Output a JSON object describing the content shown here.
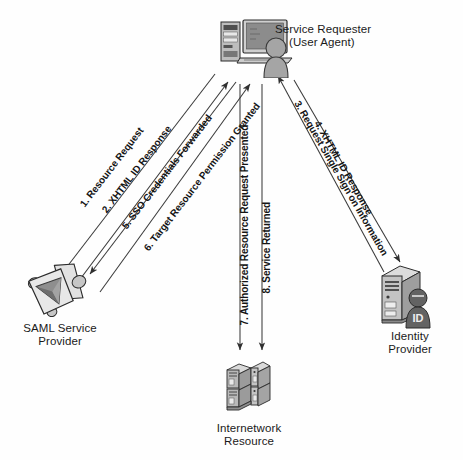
{
  "diagram": {
    "background_color": "#fefefe",
    "line_color": "#3a3a3a",
    "icon_fill_light": "#d4d4d4",
    "icon_fill_mid": "#a8a8a8",
    "icon_fill_dark": "#6f6f6f",
    "icon_outline": "#2b2b2b"
  },
  "nodes": [
    {
      "id": "service-requester",
      "label_line1": "Service Requester",
      "label_line2": "(User Agent)",
      "icon": "desktop-computer-with-user-icon"
    },
    {
      "id": "saml-service-provider",
      "label_line1": "SAML Service",
      "label_line2": "Provider",
      "icon": "saml-service-provider-icon"
    },
    {
      "id": "internetwork-resource",
      "label_line1": "Internetwork",
      "label_line2": "Resource",
      "icon": "server-rack-icon"
    },
    {
      "id": "identity-provider",
      "label_line1": "Identity",
      "label_line2": "Provider",
      "icon": "server-tower-with-id-badge-icon",
      "badge_text": "ID"
    }
  ],
  "flows": [
    {
      "number": "1.",
      "text": "1. Resource Request",
      "from": "service-requester",
      "to": "saml-service-provider"
    },
    {
      "number": "2.",
      "text": "2. XHTML ID Response",
      "from": "saml-service-provider",
      "to": "service-requester"
    },
    {
      "number": "3.",
      "text": "3. Request Single Sign on Information",
      "from": "service-requester",
      "to": "identity-provider"
    },
    {
      "number": "4.",
      "text": "4. XHTML ID Response",
      "from": "identity-provider",
      "to": "service-requester"
    },
    {
      "number": "5.",
      "text": "5. SSO Credentials Forwarded",
      "from": "service-requester",
      "to": "saml-service-provider"
    },
    {
      "number": "6.",
      "text": "6. Target Resource Permission Granted",
      "from": "saml-service-provider",
      "to": "service-requester"
    },
    {
      "number": "7.",
      "text": "7. Authorized Resource Request Presented",
      "from": "service-requester",
      "to": "internetwork-resource"
    },
    {
      "number": "8.",
      "text": "8. Service Returned",
      "from": "internetwork-resource",
      "to": "service-requester"
    }
  ]
}
